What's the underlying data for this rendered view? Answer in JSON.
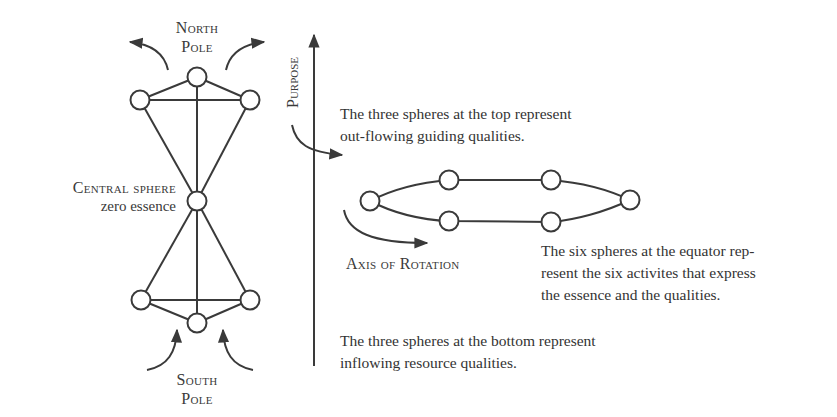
{
  "labels": {
    "north_pole_line1": "North",
    "north_pole_line2": "Pole",
    "south_pole_line1": "South",
    "south_pole_line2": "Pole",
    "central_sphere": "Central sphere",
    "central_sphere_sub": "zero essence",
    "purpose": "Purpose",
    "axis_of_rotation": "Axis of Rotation"
  },
  "descriptions": {
    "top": [
      "The three spheres at the top represent",
      "out-flowing guiding qualities."
    ],
    "equator": [
      "The six spheres at the equator rep-",
      "resent the six activites that express",
      "the essence and the qualities."
    ],
    "bottom": [
      "The three spheres at the bottom represent",
      "inflowing resource qualities."
    ]
  },
  "colors": {
    "stroke": "#3a3a3a",
    "text": "#333333",
    "background": "#ffffff"
  }
}
